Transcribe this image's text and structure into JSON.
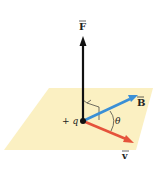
{
  "diagram": {
    "labels": {
      "force": "F",
      "field": "B",
      "velocity": "v",
      "charge": "+ q",
      "angle": "θ"
    },
    "colors": {
      "plane": "#fbf0c2",
      "force": "#111111",
      "field": "#3a8fd6",
      "velocity": "#e5533b",
      "charge": "#111111",
      "lines": "#333333"
    }
  }
}
